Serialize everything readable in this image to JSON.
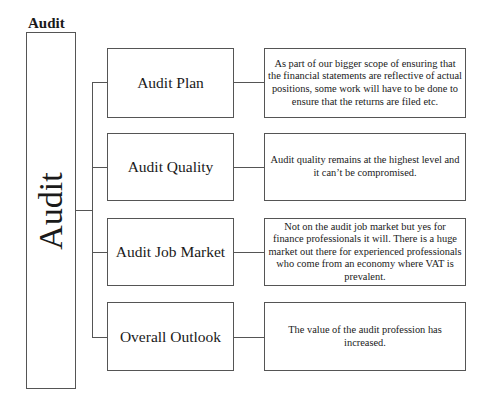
{
  "diagram": {
    "header": "Audit",
    "root": {
      "label": "Audit"
    },
    "branches": [
      {
        "label": "Audit Plan",
        "description": "As part of our bigger scope of ensuring that the financial statements are reflective of actual positions, some work will have to be done to ensure that the returns are filed etc."
      },
      {
        "label": "Audit Quality",
        "description": "Audit quality remains at the highest level and it can’t be compromised."
      },
      {
        "label": "Audit Job Market",
        "description": "Not on the audit job market but yes for finance professionals it will. There is a huge market out there for experienced professionals who come from an economy where VAT is prevalent."
      },
      {
        "label": "Overall Outlook",
        "description": "The value of the audit profession has increased."
      }
    ]
  }
}
